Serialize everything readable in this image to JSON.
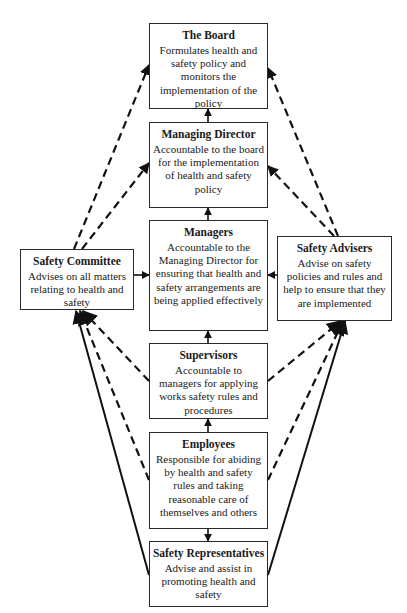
{
  "diagram": {
    "nodes": {
      "board": {
        "title": "The Board",
        "desc": "Formulates health and safety policy and monitors the implementation of the policy"
      },
      "md": {
        "title": "Managing Director",
        "desc": "Accountable to the board for the implementation of health and safety policy"
      },
      "managers": {
        "title": "Managers",
        "desc": "Accountable to the Managing Director for ensuring that health and safety arrangements are being applied effectively"
      },
      "supervisors": {
        "title": "Supervisors",
        "desc": "Accountable to managers for applying works safety rules and procedures"
      },
      "employees": {
        "title": "Employees",
        "desc": "Responsible for abiding by health and safety rules and taking reasonable care of themselves and others"
      },
      "reps": {
        "title": "Safety Representatives",
        "desc": "Advise and assist in promoting health and safety"
      },
      "committee": {
        "title": "Safety Committee",
        "desc": "Advises on all matters relating to health and safety"
      },
      "advisers": {
        "title": "Safety Advisers",
        "desc": "Advise on safety policies and rules and help to ensure that they are implemented"
      }
    },
    "edges": [
      {
        "from": "md",
        "to": "board",
        "style": "solid"
      },
      {
        "from": "managers",
        "to": "md",
        "style": "solid"
      },
      {
        "from": "supervisors",
        "to": "managers",
        "style": "solid"
      },
      {
        "from": "employees",
        "to": "supervisors",
        "style": "solid"
      },
      {
        "from": "employees",
        "to": "reps",
        "style": "solid"
      },
      {
        "from": "committee",
        "to": "managers",
        "style": "solid"
      },
      {
        "from": "advisers",
        "to": "managers",
        "style": "solid"
      },
      {
        "from": "committee",
        "to": "board",
        "style": "dashed"
      },
      {
        "from": "committee",
        "to": "md",
        "style": "dashed"
      },
      {
        "from": "advisers",
        "to": "board",
        "style": "dashed"
      },
      {
        "from": "advisers",
        "to": "md",
        "style": "dashed"
      },
      {
        "from": "supervisors",
        "to": "committee",
        "style": "dashed"
      },
      {
        "from": "employees",
        "to": "committee",
        "style": "dashed"
      },
      {
        "from": "supervisors",
        "to": "advisers",
        "style": "dashed"
      },
      {
        "from": "employees",
        "to": "advisers",
        "style": "dashed"
      },
      {
        "from": "reps",
        "to": "committee",
        "style": "solid"
      },
      {
        "from": "reps",
        "to": "advisers",
        "style": "solid"
      }
    ]
  }
}
